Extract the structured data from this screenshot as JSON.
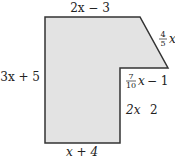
{
  "figure": {
    "fill_color": "#e3e3e3",
    "stroke_color": "#333333",
    "labels": {
      "top": "2x − 3",
      "slant": {
        "numerator": "4",
        "denominator": "5",
        "var": "x"
      },
      "left": "3x + 5",
      "inner_top": {
        "numerator": "7",
        "denominator": "10",
        "var": "x",
        "rest": "− 1"
      },
      "inner_right": {
        "a": "2x",
        "b": "2"
      },
      "bottom": "x + 4"
    }
  }
}
